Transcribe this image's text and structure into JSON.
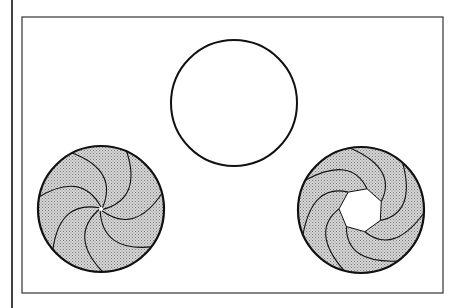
{
  "diagram": {
    "type": "iris-aperture-states",
    "colors": {
      "stroke": "#111111",
      "blade_fill": "#bdbdbd",
      "background": "#ffffff"
    },
    "figures": [
      {
        "id": "open",
        "label": "",
        "cx": 234,
        "cy": 103,
        "r": 63,
        "blades": 0,
        "aperture_r": 63
      },
      {
        "id": "closed",
        "label": "",
        "cx": 101,
        "cy": 209,
        "r": 63,
        "blades": 7,
        "aperture_r": 2
      },
      {
        "id": "partial",
        "label": "",
        "cx": 361,
        "cy": 210,
        "r": 63,
        "blades": 7,
        "aperture_r": 22
      }
    ]
  }
}
